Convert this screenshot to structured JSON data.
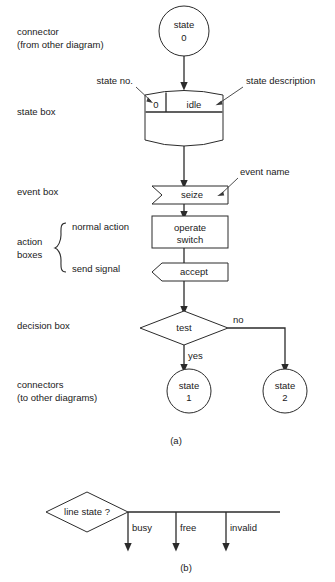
{
  "figure": {
    "panel_a_caption": "(a)",
    "panel_b_caption": "(b)"
  },
  "annotations": {
    "connector_line1": "connector",
    "connector_line2": "(from other diagram)",
    "state_box": "state box",
    "state_no": "state no.",
    "state_description": "state description",
    "event_box": "event box",
    "event_name": "event name",
    "action_boxes_line1": "action",
    "action_boxes_line2": "boxes",
    "normal_action": "normal action",
    "send_signal": "send signal",
    "decision_box": "decision box",
    "connectors_line1": "connectors",
    "connectors_line2": "(to other diagrams)"
  },
  "panel_a": {
    "start_connector": {
      "line1": "state",
      "line2": "0"
    },
    "state_box": {
      "number": "0",
      "description": "idle"
    },
    "event_box": {
      "label": "seize"
    },
    "normal_action_box": {
      "line1": "operate",
      "line2": "switch"
    },
    "send_signal_box": {
      "label": "accept"
    },
    "decision_box": {
      "label": "test",
      "branch_yes": "yes",
      "branch_no": "no"
    },
    "end_connector_yes": {
      "line1": "state",
      "line2": "1"
    },
    "end_connector_no": {
      "line1": "state",
      "line2": "2"
    }
  },
  "panel_b": {
    "decision_box": {
      "label": "line state ?"
    },
    "branches": [
      {
        "label": "busy"
      },
      {
        "label": "free"
      },
      {
        "label": "invalid"
      }
    ]
  },
  "colors": {
    "ink": "#2b2b2b",
    "text": "#1a1a1a",
    "paper": "#ffffff"
  }
}
